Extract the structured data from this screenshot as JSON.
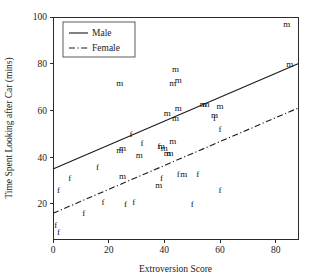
{
  "chart_data": {
    "type": "scatter",
    "title": "",
    "xlabel": "Extroversion Score",
    "ylabel": "Time Spent Looking after Car (mins)",
    "xlim": [
      0,
      88
    ],
    "ylim": [
      5,
      100
    ],
    "xticks": [
      0,
      20,
      40,
      60,
      80
    ],
    "yticks": [
      20,
      40,
      60,
      80,
      100
    ],
    "grid": false,
    "legend_position": "top-left",
    "legend": [
      {
        "label": "Male",
        "marker": "m",
        "line": "solid"
      },
      {
        "label": "Female",
        "marker": "f",
        "line": "dash-dot"
      }
    ],
    "series": [
      {
        "name": "Male",
        "marker": "m",
        "points": [
          [
            24,
            72
          ],
          [
            44,
            78
          ],
          [
            43,
            72
          ],
          [
            45,
            73
          ],
          [
            84,
            97
          ],
          [
            85,
            80
          ],
          [
            41,
            59
          ],
          [
            45,
            61
          ],
          [
            44,
            57
          ],
          [
            54,
            63
          ],
          [
            55,
            63
          ],
          [
            60,
            62
          ],
          [
            58,
            58
          ],
          [
            25,
            44
          ],
          [
            24,
            43
          ],
          [
            43,
            47
          ],
          [
            39,
            45
          ],
          [
            40,
            44
          ],
          [
            41,
            42
          ],
          [
            42,
            42
          ],
          [
            31,
            41
          ],
          [
            25,
            32
          ],
          [
            38,
            28
          ],
          [
            47,
            33
          ]
        ],
        "fit_line": {
          "x1": 0,
          "y1": 35,
          "x2": 88,
          "y2": 80
        }
      },
      {
        "name": "Female",
        "marker": "f",
        "points": [
          [
            28,
            50
          ],
          [
            32,
            46
          ],
          [
            38,
            45
          ],
          [
            60,
            52
          ],
          [
            58,
            57
          ],
          [
            16,
            36
          ],
          [
            6,
            31
          ],
          [
            2,
            26
          ],
          [
            39,
            31
          ],
          [
            45,
            33
          ],
          [
            52,
            33
          ],
          [
            60,
            26
          ],
          [
            18,
            21
          ],
          [
            26,
            20
          ],
          [
            29,
            21
          ],
          [
            11,
            16
          ],
          [
            50,
            20
          ],
          [
            1,
            11
          ],
          [
            2,
            8
          ]
        ],
        "fit_line": {
          "x1": 0,
          "y1": 16,
          "x2": 88,
          "y2": 61
        }
      }
    ]
  },
  "axes": {
    "x_label": "Extroversion Score",
    "y_label": "Time Spent Looking after Car (mins)",
    "x_tick_labels": [
      "0",
      "20",
      "40",
      "60",
      "80"
    ],
    "y_tick_labels": [
      "20",
      "40",
      "60",
      "80",
      "100"
    ]
  },
  "legend": {
    "male_label": "Male",
    "female_label": "Female"
  },
  "colors": {
    "axis": "#2b2b2b",
    "text": "#1a1a1a",
    "line": "#1a1a1a",
    "background": "#ffffff"
  }
}
